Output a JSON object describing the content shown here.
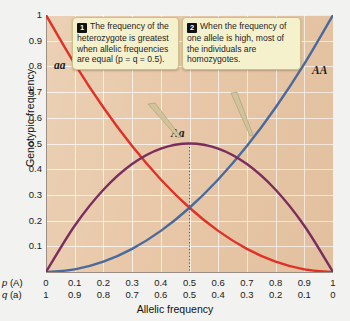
{
  "chart_data": {
    "type": "line",
    "title": "",
    "xlabel": "Allelic frequency",
    "ylabel": "Genotypic frequency",
    "xlim": [
      0,
      1
    ],
    "ylim": [
      0,
      1
    ],
    "grid": true,
    "legend_position": "inline-curve-labels",
    "x_axis_rows": [
      {
        "name": "p (A)",
        "symbol": "p",
        "allele": "(A)",
        "ticks": [
          "0",
          "0.1",
          "0.2",
          "0.3",
          "0.4",
          "0.5",
          "0.6",
          "0.7",
          "0.8",
          "0.9",
          "1"
        ]
      },
      {
        "name": "q (a)",
        "symbol": "q",
        "allele": "(a)",
        "ticks": [
          "1",
          "0.9",
          "0.8",
          "0.7",
          "0.6",
          "0.5",
          "0.4",
          "0.3",
          "0.2",
          "0.1",
          "0"
        ]
      }
    ],
    "y_ticks": [
      "1",
      "0.9",
      "0.8",
      "0.7",
      "0.6",
      "0.5",
      "0.4",
      "0.3",
      "0.2",
      "0.1"
    ],
    "y_tick_values": [
      1,
      0.9,
      0.8,
      0.7,
      0.6,
      0.5,
      0.4,
      0.3,
      0.2,
      0.1
    ],
    "x": [
      0,
      0.1,
      0.2,
      0.3,
      0.4,
      0.5,
      0.6,
      0.7,
      0.8,
      0.9,
      1
    ],
    "series": [
      {
        "name": "aa",
        "label": "aa",
        "formula": "q^2",
        "color": "#e03127",
        "values": [
          1,
          0.81,
          0.64,
          0.49,
          0.36,
          0.25,
          0.16,
          0.09,
          0.04,
          0.01,
          0
        ]
      },
      {
        "name": "AA",
        "label": "AA",
        "formula": "p^2",
        "color": "#4a6a9e",
        "values": [
          0,
          0.01,
          0.04,
          0.09,
          0.16,
          0.25,
          0.36,
          0.49,
          0.64,
          0.81,
          1
        ]
      },
      {
        "name": "Aa",
        "label": "Aa",
        "formula": "2pq",
        "color": "#7b2d5e",
        "values": [
          0,
          0.18,
          0.32,
          0.42,
          0.48,
          0.5,
          0.48,
          0.42,
          0.32,
          0.18,
          0
        ]
      }
    ],
    "annotations": [
      {
        "at_x": 0.5,
        "type": "dotted-vertical",
        "from_y": 0.5,
        "to_y": 0
      }
    ]
  },
  "axis": {
    "y_title": "Genotypic frequency",
    "x_title": "Allelic frequency"
  },
  "curve_labels": {
    "aa": "aa",
    "AA": "AA",
    "Aa": "Aa"
  },
  "callouts": [
    {
      "number": "1",
      "text": "The frequency of the heterozygote is greatest when allelic frequencies are equal (p = q = 0.5)."
    },
    {
      "number": "2",
      "text": "When the frequency of one allele is high, most of the individuals are homozygotes."
    }
  ],
  "colors": {
    "plot_background": "#e8c8a8",
    "gridline": "#ffffff",
    "callout_background": "#f6f1cd",
    "callout_border": "#cdbf8c",
    "badge_background": "#111111",
    "aa_curve": "#e03127",
    "AA_curve": "#4a6a9e",
    "Aa_curve": "#7b2d5e"
  }
}
